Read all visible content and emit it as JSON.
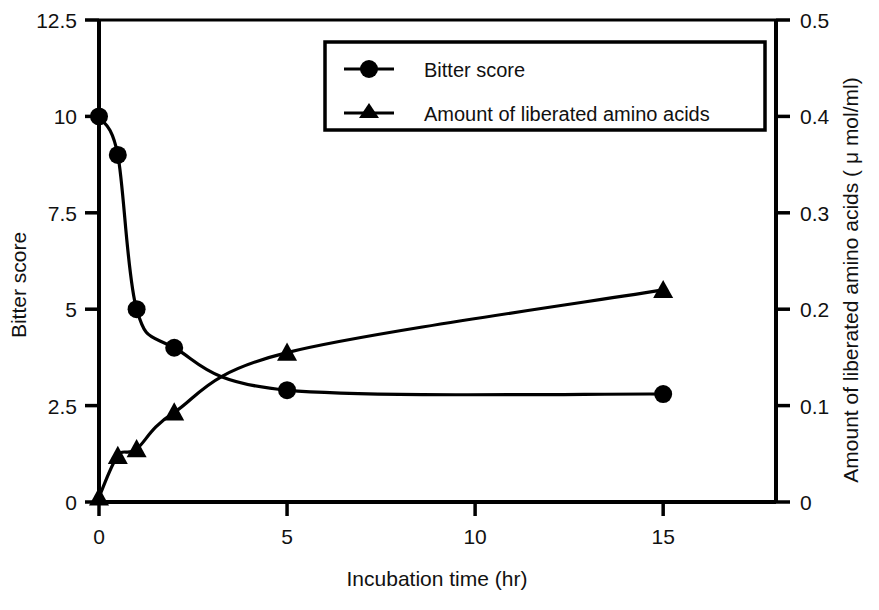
{
  "chart_data": {
    "type": "line",
    "title": "",
    "xlabel": "Incubation time (hr)",
    "ylabel": "Bitter score",
    "y2label": "Amount of liberated amino acids ( μ mol/ml)",
    "xlim": [
      0,
      18
    ],
    "ylim": [
      0,
      12.5
    ],
    "y2lim": [
      0,
      0.5
    ],
    "xticks": [
      "0",
      "5",
      "10",
      "15"
    ],
    "xtick_values": [
      0,
      5,
      10,
      15
    ],
    "yticks": [
      "0",
      "2.5",
      "5",
      "7.5",
      "10",
      "12.5"
    ],
    "ytick_values": [
      0,
      2.5,
      5,
      7.5,
      10,
      12.5
    ],
    "y2ticks": [
      "0",
      "0.1",
      "0.2",
      "0.3",
      "0.4",
      "0.5"
    ],
    "y2tick_values": [
      0,
      0.1,
      0.2,
      0.3,
      0.4,
      0.5
    ],
    "grid": false,
    "legend_position": "top-right",
    "series": [
      {
        "name": "Bitter score",
        "marker": "circle",
        "axis": "left",
        "x": [
          0,
          0.5,
          1,
          2,
          5,
          15
        ],
        "values": [
          10,
          9,
          5,
          4,
          2.9,
          2.8
        ]
      },
      {
        "name": "Amount of liberated amino acids",
        "marker": "triangle",
        "axis": "right",
        "x": [
          0,
          0.5,
          1,
          2,
          5,
          15
        ],
        "values": [
          0.005,
          0.048,
          0.055,
          0.093,
          0.155,
          0.22
        ]
      }
    ]
  },
  "legend": {
    "items": [
      {
        "label": "Bitter score",
        "marker": "circle"
      },
      {
        "label": "Amount of liberated amino acids",
        "marker": "triangle"
      }
    ]
  },
  "colors": {
    "line": "#000000",
    "marker": "#000000",
    "axis": "#000000",
    "background": "#ffffff"
  }
}
